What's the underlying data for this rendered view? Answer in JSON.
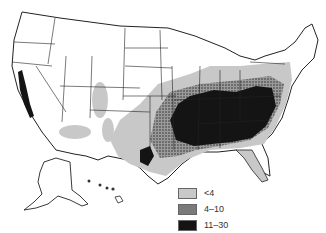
{
  "map": {
    "type": "choropleth",
    "region": "United States (incl. Alaska, Hawaii)",
    "style": "grayscale",
    "legend": {
      "items": [
        {
          "label": "<4",
          "fill": "#c8c8c8"
        },
        {
          "label": "4–10",
          "fill": "#7a7a7a"
        },
        {
          "label": "11–30",
          "fill": "#141414"
        }
      ]
    }
  },
  "colors": {
    "background": "#ffffff",
    "border": "#222222",
    "low": "#c8c8c8",
    "mid": "#7a7a7a",
    "high": "#141414"
  }
}
